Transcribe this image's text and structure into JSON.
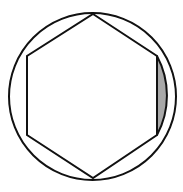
{
  "figure": {
    "title": "Regular hexagon inscribed in a circle with one shaded circular segment",
    "type": "geometry-diagram",
    "background_color": "#ffffff",
    "stroke_color": "#111111",
    "stroke_width": 2,
    "canvas": {
      "width": 183,
      "height": 192
    },
    "circle": {
      "name": "circumscribed-circle",
      "center_x": 92.5,
      "center_y": 96.5,
      "radius": 83.5,
      "fill": "none",
      "stroke": "#111111"
    },
    "hexagon": {
      "name": "inscribed-regular-hexagon",
      "sides": 6,
      "fill": "#ffffff",
      "stroke": "#111111",
      "vertices": [
        {
          "label": "top",
          "x": 93,
          "y": 14
        },
        {
          "label": "upper-right",
          "x": 157,
          "y": 56
        },
        {
          "label": "lower-right",
          "x": 157,
          "y": 135
        },
        {
          "label": "bottom",
          "x": 93,
          "y": 178
        },
        {
          "label": "lower-left",
          "x": 27,
          "y": 135
        },
        {
          "label": "upper-left",
          "x": 27,
          "y": 56
        }
      ],
      "points_attr": "93,14 157,56 157,135 93,178 27,135 27,56"
    },
    "shaded_segment": {
      "name": "right-circular-segment",
      "description": "Circular segment between the right vertical hexagon side and the circle arc",
      "fill_color": "#a8a8a8",
      "stroke": "#111111",
      "chord_start_x": 157,
      "chord_start_y": 56,
      "chord_end_x": 157,
      "chord_end_y": 135,
      "arc_apex_x": 176,
      "arc_apex_y": 96,
      "path_attr": "M 157 56 A 83.5 83.5 0 0 1 157 135 L 157 56 Z"
    }
  }
}
